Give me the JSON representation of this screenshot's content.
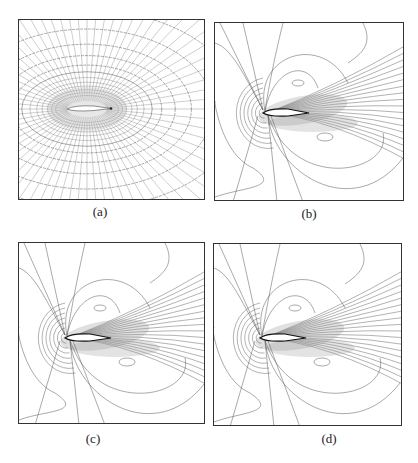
{
  "figure": {
    "panels": [
      {
        "id": "a",
        "caption": "(a)",
        "content": "computational mesh around airfoil"
      },
      {
        "id": "b",
        "caption": "(b)",
        "content": "flow field contour lines around airfoil"
      },
      {
        "id": "c",
        "caption": "(c)",
        "content": "flow field contour lines around airfoil"
      },
      {
        "id": "d",
        "caption": "(d)",
        "content": "flow field contour lines around airfoil"
      }
    ]
  },
  "colors": {
    "line": "#555555",
    "frame": "#333333",
    "background": "#ffffff"
  }
}
